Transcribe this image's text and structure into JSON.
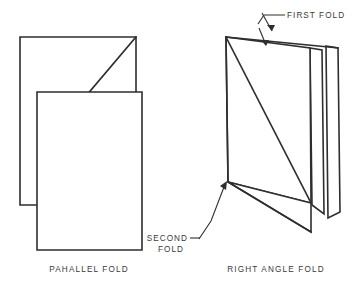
{
  "figure": {
    "background_color": "#ffffff",
    "line_color": "#2e2e2e",
    "text_color": "#3a3a3a"
  },
  "captions": {
    "left": "PAHALLEL FOLD",
    "right": "RIGHT ANGLE FOLD"
  },
  "callouts": {
    "first_fold": "FIRST FOLD",
    "second_fold_line1": "SECOND",
    "second_fold_line2": "FOLD"
  },
  "diagrams": [
    {
      "name": "parallel-fold",
      "caption": "PAHALLEL FOLD",
      "panels": [
        {
          "name": "back-panel",
          "points": "20,37 136,37 136,129 58,129 58,205 20,205"
        },
        {
          "name": "front-panel",
          "points": "37,92 142,92 142,250 37,250"
        }
      ],
      "fold_edges": [
        {
          "name": "diagonal-fold-line",
          "points": "136,37 58,129"
        }
      ]
    },
    {
      "name": "right-angle-fold",
      "caption": "RIGHT ANGLE FOLD",
      "panels": [
        {
          "name": "front-left-panel",
          "points": "226,37 228,182 228,182 226,37"
        },
        {
          "name": "front-right-panel",
          "points": "226,37 310,48 311,203 228,182"
        },
        {
          "name": "rear-thin-panel-a",
          "points": "310,48 322,50 324,214 312,205"
        },
        {
          "name": "rear-thin-panel-b",
          "points": "326,46 338,48 340,212 328,218"
        }
      ],
      "fold_edges": [
        {
          "name": "first-fold-top-edge",
          "points": "226,37 338,48"
        },
        {
          "name": "first-fold-diagonal",
          "points": "226,37 311,203"
        },
        {
          "name": "second-fold-vertical",
          "points": "226,37 228,182"
        },
        {
          "name": "second-fold-bottom-edge",
          "points": "228,182 311,232"
        }
      ]
    }
  ]
}
